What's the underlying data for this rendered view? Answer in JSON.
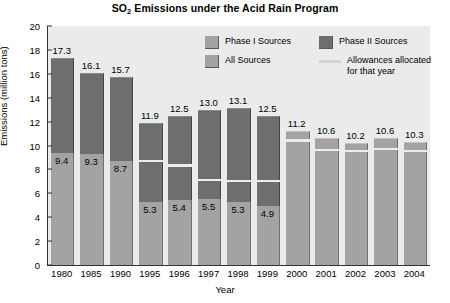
{
  "chart_data": {
    "type": "bar",
    "title": "SO2 Emissions under the Acid Rain Program",
    "title_main": "SO",
    "title_sub": "2",
    "title_rest": " Emissions under the Acid Rain Program",
    "xlabel": "Year",
    "ylabel": "Emissions (million tons)",
    "ylim": [
      0,
      20
    ],
    "ytick_values": [
      0,
      2,
      4,
      6,
      8,
      10,
      12,
      14,
      16,
      18,
      20
    ],
    "ytick_labels": [
      "0",
      "2",
      "4",
      "6",
      "8",
      "10",
      "12",
      "14",
      "16",
      "18",
      "20"
    ],
    "grid": false,
    "legend_position": "upper-right-inside",
    "categories": [
      "1980",
      "1985",
      "1990",
      "1995",
      "1996",
      "1997",
      "1998",
      "1999",
      "2000",
      "2001",
      "2002",
      "2003",
      "2004"
    ],
    "series": [
      {
        "name": "Phase I Sources",
        "color": "#a3a3a3",
        "values": [
          9.4,
          9.3,
          8.7,
          5.3,
          5.4,
          5.5,
          5.3,
          4.9,
          null,
          null,
          null,
          null,
          null
        ]
      },
      {
        "name": "Phase II Sources",
        "color": "#6e6e6e",
        "values": [
          7.9,
          6.8,
          7.0,
          6.6,
          7.1,
          7.5,
          7.8,
          7.6,
          null,
          null,
          null,
          null,
          null
        ]
      },
      {
        "name": "All Sources",
        "color": "#a3a3a3",
        "values": [
          null,
          null,
          null,
          null,
          null,
          null,
          null,
          null,
          11.2,
          10.6,
          10.2,
          10.6,
          10.3
        ]
      },
      {
        "name": "Allowances allocated for that year",
        "color": "#ececec",
        "values": [
          null,
          null,
          null,
          8.7,
          8.3,
          7.1,
          7.0,
          7.0,
          10.4,
          9.6,
          9.5,
          9.7,
          9.5
        ]
      }
    ],
    "totals": [
      17.3,
      16.1,
      15.7,
      11.9,
      12.5,
      13.0,
      13.1,
      12.5,
      11.2,
      10.6,
      10.2,
      10.6,
      10.3
    ],
    "total_labels": [
      "17.3",
      "16.1",
      "15.7",
      "11.9",
      "12.5",
      "13.0",
      "13.1",
      "12.5",
      "11.2",
      "10.6",
      "10.2",
      "10.6",
      "10.3"
    ],
    "phase1_labels": [
      "9.4",
      "9.3",
      "8.7",
      "5.3",
      "5.4",
      "5.5",
      "5.3",
      "4.9",
      "",
      "",
      "",
      "",
      ""
    ],
    "legend": [
      {
        "label": "Phase I Sources",
        "swatch": "light"
      },
      {
        "label": "Phase II Sources",
        "swatch": "dark"
      },
      {
        "label": "All Sources",
        "swatch": "light"
      },
      {
        "label": "Allowances allocated for that year",
        "swatch": "line"
      }
    ],
    "colors": {
      "phase1": "#a3a3a3",
      "phase2": "#6e6e6e",
      "all": "#a3a3a3",
      "allowance": "#ececec",
      "plot_background": "#ebebeb",
      "axis": "#333333"
    }
  }
}
